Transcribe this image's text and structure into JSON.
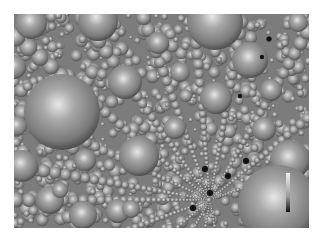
{
  "image": {
    "description": "Grayscale rendering of a dense sphere packing with radiating chains of small spheres",
    "background": "#ffffff",
    "frame": {
      "x": 14,
      "y": 14,
      "width": 295,
      "height": 214
    },
    "base_color": "#7c7c7c",
    "sphere_light": "#e6e6e6",
    "sphere_mid": "#9a9a9a",
    "sphere_dark": "#4a4a4a"
  },
  "large_spheres": [
    {
      "cx": 31,
      "cy": 23,
      "r": 16
    },
    {
      "cx": 98,
      "cy": 21,
      "r": 20
    },
    {
      "cx": 215,
      "cy": 22,
      "r": 28
    },
    {
      "cx": 62,
      "cy": 112,
      "r": 38
    },
    {
      "cx": 250,
      "cy": 60,
      "r": 18
    },
    {
      "cx": 125,
      "cy": 82,
      "r": 17
    },
    {
      "cx": 216,
      "cy": 98,
      "r": 16
    },
    {
      "cx": 139,
      "cy": 156,
      "r": 20
    },
    {
      "cx": 290,
      "cy": 160,
      "r": 20
    },
    {
      "cx": 278,
      "cy": 205,
      "r": 40
    },
    {
      "cx": 22,
      "cy": 166,
      "r": 16
    },
    {
      "cx": 50,
      "cy": 200,
      "r": 14
    },
    {
      "cx": 83,
      "cy": 215,
      "r": 14
    },
    {
      "cx": 118,
      "cy": 211,
      "r": 12
    },
    {
      "cx": 85,
      "cy": 160,
      "r": 11
    },
    {
      "cx": 158,
      "cy": 43,
      "r": 11
    },
    {
      "cx": 264,
      "cy": 129,
      "r": 12
    },
    {
      "cx": 271,
      "cy": 90,
      "r": 11
    },
    {
      "cx": 14,
      "cy": 67,
      "r": 12
    },
    {
      "cx": 17,
      "cy": 126,
      "r": 10
    },
    {
      "cx": 175,
      "cy": 128,
      "r": 11
    },
    {
      "cx": 60,
      "cy": 190,
      "r": 8
    },
    {
      "cx": 131,
      "cy": 209,
      "r": 9
    },
    {
      "cx": 180,
      "cy": 72,
      "r": 10
    },
    {
      "cx": 298,
      "cy": 22,
      "r": 10
    }
  ],
  "dark_spheres": [
    {
      "cx": 269,
      "cy": 39,
      "r": 3
    },
    {
      "cx": 262,
      "cy": 57,
      "r": 2.5
    },
    {
      "cx": 240,
      "cy": 96,
      "r": 2.5
    },
    {
      "cx": 246,
      "cy": 161,
      "r": 3.5
    },
    {
      "cx": 205,
      "cy": 169,
      "r": 3.5
    },
    {
      "cx": 228,
      "cy": 176,
      "r": 3.5
    },
    {
      "cx": 210,
      "cy": 193,
      "r": 3.5
    },
    {
      "cx": 193,
      "cy": 208,
      "r": 3.5
    }
  ],
  "rays": {
    "origin": {
      "x": 210,
      "y": 200
    },
    "angles_deg": [
      -170,
      -155,
      -140,
      -125,
      -110,
      -95,
      -80,
      -60,
      -40,
      -20,
      180,
      160,
      140,
      120,
      100,
      80
    ]
  },
  "colorbar": {
    "x": 286,
    "y": 173,
    "width": 4,
    "height": 39,
    "top_color": "#f2f2f2",
    "bottom_color": "#111111",
    "label": ""
  }
}
